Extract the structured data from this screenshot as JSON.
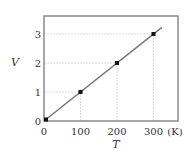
{
  "chart_data": {
    "type": "line",
    "title": "",
    "xlabel": "T",
    "ylabel": "V",
    "x_unit": "(K)",
    "xlim": [
      0,
      367
    ],
    "ylim": [
      0,
      3.6
    ],
    "x_ticks": [
      0,
      100,
      200,
      300
    ],
    "y_ticks": [
      0,
      1,
      2,
      3
    ],
    "x_tick_labels": [
      "0",
      "100",
      "200",
      "300"
    ],
    "y_tick_labels": [
      "0",
      "1",
      "2",
      "3"
    ],
    "grid": "partial dashed guides from axes to data points",
    "legend": null,
    "series": [
      {
        "name": "V vs T",
        "points": [
          {
            "x": 0,
            "y": 0
          },
          {
            "x": 100,
            "y": 1
          },
          {
            "x": 200,
            "y": 2
          },
          {
            "x": 300,
            "y": 3
          }
        ],
        "fit_line": {
          "from": [
            0,
            0
          ],
          "to": [
            323,
            3.23
          ]
        }
      }
    ]
  },
  "colors": {
    "frame": "#8a8a8a",
    "line": "#777777",
    "marker": "#111111",
    "guide": "#d8d8d8",
    "text": "#333333"
  }
}
